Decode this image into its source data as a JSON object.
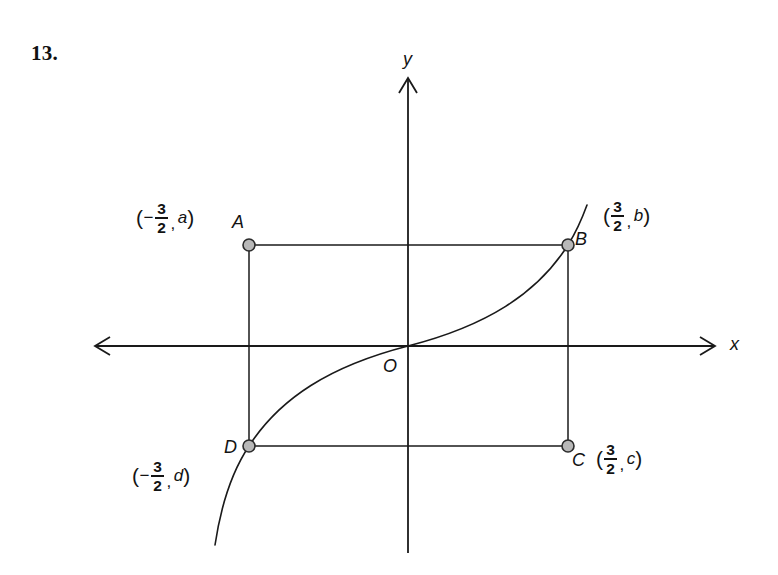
{
  "problem": {
    "number": "13."
  },
  "figure": {
    "type": "coordinate-geometry-diagram",
    "background_color": "#ffffff",
    "line_color": "#1a1a1a",
    "point_fill_color": "#b8b8b8",
    "point_stroke_color": "#2b2b2b",
    "axes": {
      "x_axis_label": "x",
      "y_axis_label": "y",
      "origin_label": "O",
      "x_axis_y_px": 346,
      "y_axis_x_px": 408,
      "x_axis_from_px": 95,
      "x_axis_to_px": 715,
      "y_axis_from_px": 78,
      "y_axis_to_px": 553,
      "arrow_directions": [
        "left",
        "right",
        "up"
      ]
    },
    "rectangle": {
      "name": "ABCD",
      "left_px": 249,
      "right_px": 568,
      "top_px": 245,
      "bottom_px": 446
    },
    "points": [
      {
        "id": "A",
        "label": "A",
        "x_px": 249,
        "y_px": 245,
        "label_x_px": 232,
        "label_y_px": 213,
        "coord_x_text": "-3/2",
        "coord_y_text": "a"
      },
      {
        "id": "B",
        "label": "B",
        "x_px": 568,
        "y_px": 245,
        "label_x_px": 575,
        "label_y_px": 230,
        "coord_x_text": "3/2",
        "coord_y_text": "b"
      },
      {
        "id": "C",
        "label": "C",
        "x_px": 568,
        "y_px": 446,
        "label_x_px": 572,
        "label_y_px": 451,
        "coord_x_text": "3/2",
        "coord_y_text": "c"
      },
      {
        "id": "D",
        "label": "D",
        "x_px": 249,
        "y_px": 446,
        "label_x_px": 224,
        "label_y_px": 438,
        "coord_x_text": "-3/2",
        "coord_y_text": "d"
      }
    ],
    "coordinate_labels": [
      {
        "id": "label-A",
        "for_point": "A",
        "open_paren": "(",
        "sign": "−",
        "numerator": "3",
        "denominator": "2",
        "comma": ",",
        "variable": "a",
        "close_paren": ")",
        "left_px": 136,
        "top_px": 201
      },
      {
        "id": "label-B",
        "for_point": "B",
        "open_paren": "(",
        "sign": "",
        "numerator": "3",
        "denominator": "2",
        "comma": ",",
        "variable": "b",
        "close_paren": ")",
        "left_px": 603,
        "top_px": 199
      },
      {
        "id": "label-C",
        "for_point": "C",
        "open_paren": "(",
        "sign": "",
        "numerator": "3",
        "denominator": "2",
        "comma": ",",
        "variable": "c",
        "close_paren": ")",
        "left_px": 596,
        "top_px": 442
      },
      {
        "id": "label-D",
        "for_point": "D",
        "open_paren": "(",
        "sign": "−",
        "numerator": "3",
        "denominator": "2",
        "comma": ",",
        "variable": "d",
        "close_paren": ")",
        "left_px": 132,
        "top_px": 459
      }
    ],
    "curve": {
      "id": "cubic-curve",
      "shape": "odd cubic through origin",
      "path": "M 215,545 C 221,505 233,470 249,446 C 280,398 330,366 408,346 C 486,326 537,294 568,245 C 578,229 583,216 587,205",
      "passes_through": [
        "D",
        "O",
        "B"
      ]
    }
  }
}
